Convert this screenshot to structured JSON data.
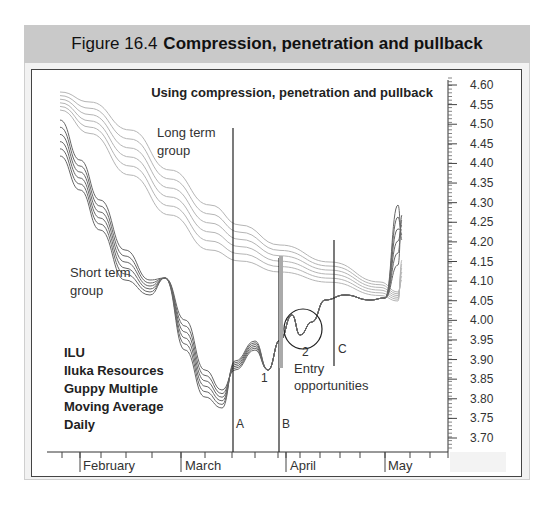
{
  "figure": {
    "number": "Figure 16.4",
    "title": "Compression, penetration and pullback"
  },
  "chart_data": {
    "type": "line",
    "title": "Using compression, penetration and pullback",
    "xlabel": "",
    "ylabel": "",
    "ylim": [
      3.68,
      4.62
    ],
    "y_ticks": [
      "4.60",
      "4.55",
      "4.50",
      "4.45",
      "4.40",
      "4.35",
      "4.30",
      "4.25",
      "4.20",
      "4.15",
      "4.10",
      "4.05",
      "4.00",
      "3.95",
      "3.90",
      "3.85",
      "3.80",
      "3.75",
      "3.70"
    ],
    "x_ticks": [
      "February",
      "March",
      "April",
      "May"
    ],
    "grid": false,
    "legend": "none",
    "annotations": {
      "long_term": "Long term group",
      "short_term": "Short term group",
      "info_lines": [
        "ILU",
        "Iluka Resources",
        "Guppy Multiple",
        "Moving Average",
        "Daily"
      ],
      "marker_a": "A",
      "marker_b": "B",
      "marker_c": "C",
      "point_1": "1",
      "point_2": "2",
      "entry": "Entry opportunities"
    },
    "series_groups": [
      {
        "name": "Short term group",
        "note": "6 short-term moving averages (darker lines)",
        "approx_path": [
          {
            "period": "late Jan",
            "value": 4.5
          },
          {
            "period": "early Feb",
            "value": 4.38
          },
          {
            "period": "mid Feb",
            "value": 4.2
          },
          {
            "period": "late Feb",
            "value": 4.05
          },
          {
            "period": "early Mar",
            "value": 3.78
          },
          {
            "period": "A (mid Mar)",
            "value": 3.82
          },
          {
            "period": "point 1 (late Mar)",
            "value": 3.9
          },
          {
            "period": "B (end Mar)",
            "value": 3.93
          },
          {
            "period": "point 2 (early Apr)",
            "value": 3.95
          },
          {
            "period": "C (mid Apr)",
            "value": 3.96
          },
          {
            "period": "late Apr",
            "value": 3.98
          },
          {
            "period": "early May",
            "value": 4.22
          }
        ]
      },
      {
        "name": "Long term group",
        "note": "6 long-term moving averages (lighter lines)",
        "approx_path": [
          {
            "period": "late Jan",
            "value": 4.57
          },
          {
            "period": "mid Feb",
            "value": 4.42
          },
          {
            "period": "early Mar",
            "value": 4.22
          },
          {
            "period": "A (mid Mar)",
            "value": 4.1
          },
          {
            "period": "B (end Mar)",
            "value": 4.04
          },
          {
            "period": "C (mid Apr)",
            "value": 4.01
          },
          {
            "period": "late Apr",
            "value": 4.0
          },
          {
            "period": "early May",
            "value": 4.1
          }
        ]
      }
    ]
  }
}
